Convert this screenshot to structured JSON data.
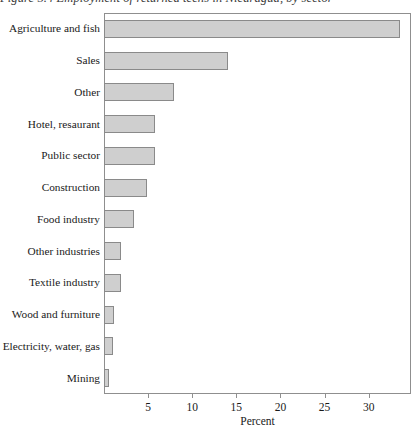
{
  "figure": {
    "title": "Figure 5.4 Employment of returned teens in Nicaragua, by sector"
  },
  "chart_data": {
    "type": "bar",
    "orientation": "horizontal",
    "title": "Figure 5.4 Employment of returned teens in Nicaragua, by sector",
    "xlabel": "Percent",
    "ylabel": "",
    "xlim": [
      0,
      34.8
    ],
    "xticks": [
      5,
      10,
      15,
      20,
      25,
      30
    ],
    "xtick_labels": [
      "5",
      "10",
      "15",
      "20",
      "25",
      "30"
    ],
    "grid": false,
    "legend": false,
    "bar_fill_color": "#cfcfcf",
    "bar_edge_color": "#8a8a8a",
    "categories": [
      "Agriculture and fish",
      "Sales",
      "Other",
      "Hotel, resaurant",
      "Public sector",
      "Construction",
      "Food industry",
      "Other industries",
      "Textile industry",
      "Wood and furniture",
      "Electricity, water, gas",
      "Mining"
    ],
    "values": [
      33.5,
      14.0,
      7.9,
      5.8,
      5.8,
      4.9,
      3.4,
      1.9,
      1.9,
      1.1,
      1.0,
      0.6
    ]
  }
}
